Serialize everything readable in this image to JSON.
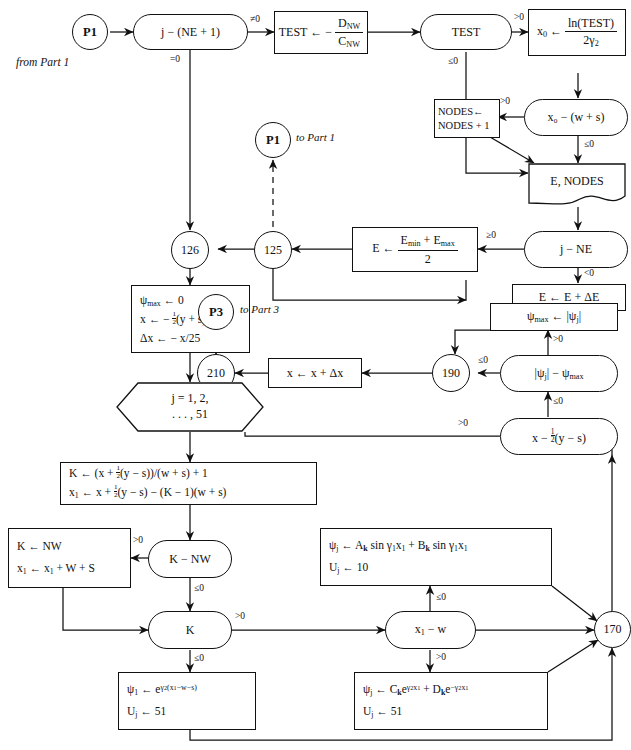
{
  "diagram": {
    "annotations": [
      {
        "name": "from-part-1-note",
        "text": "from Part 1"
      },
      {
        "name": "to-part-1-note",
        "text": "to Part 1"
      },
      {
        "name": "to-part-3-note",
        "text": "to Part 3"
      }
    ],
    "connectors": {
      "p1_in": "P1",
      "p1_out": "P1",
      "p3_out": "P3",
      "c126": "126",
      "c125": "125",
      "c210": "210",
      "c190": "190",
      "c170": "170"
    },
    "nodes": {
      "j_minus_ne1": "j − (NE + 1)",
      "test_assign_num": "D",
      "test_assign_num_sub": "NW",
      "test_assign_den": "C",
      "test_assign_den_sub": "NW",
      "test_assign_prefix": "TEST ← −",
      "test_decision": "TEST",
      "x0_assign_lhs": "x",
      "x0_assign_lhs_sub": "0",
      "x0_num": "ln(TEST)",
      "x0_den_coef": "2",
      "x0_den_sym": "γ",
      "x0_den_sub": "2",
      "x0_minus_ws": "x₀ − (w + s)",
      "nodes_incr_line1": "NODES←",
      "nodes_incr_line2": "NODES + 1",
      "e_nodes_doc": "E, NODES",
      "j_minus_ne": "j − NE",
      "e_bisect_prefix": "E ←",
      "e_bisect_num": "Eₘᵢₙ + Eₘₐₓ",
      "e_bisect_den": "2",
      "e_increment": "E ← E + ΔE",
      "init_line1": "ψₘₐₓ ← 0",
      "init_line2": "x ← − ½(y + s)",
      "init_line3": "Δx ← − x/25",
      "loop_line1": "j = 1, 2,",
      "loop_line2": ". . . , 51",
      "k_calc_line1": "K ← (x + ½(y − s))/(w + s) + 1",
      "k_calc_line2": "x₁ ← x + ½(y − s) − (K − 1)(w + s)",
      "k_minus_nw": "K − NW",
      "k_clamp_line1": "K ← NW",
      "k_clamp_line2": "x₁ ← x₁ + W + S",
      "k_decision": "K",
      "x1_minus_w": "x₁ − w",
      "psi_trig_line1": "ψⱼ ← Aₖ sin γ₁x₁ + Bₖ sin γ₁x₁",
      "psi_trig_line2": "Uⱼ ← 10",
      "psi_exp_line1": "ψⱼ ← Cₖe^{γ₂x₁} + Dₖe^{−γ₂x₁}",
      "psi_exp_line2": "Uⱼ ← 51",
      "psi1_exp_line1": "ψ₁ ← e^{γ₂(x₁−w−s)}",
      "psi1_exp_line2": "Uⱼ ← 51",
      "x_step": "x ← x + Δx",
      "psi_abs_cmp": "|ψⱼ| − ψₘₐₓ",
      "psimax_update": "ψₘₐₓ ← |ψⱼ|",
      "x_minus_half": "x − ½(y − s)"
    },
    "edge_labels": {
      "ne_zero": "≠0",
      "eq_zero": "=0",
      "gt_zero_test": ">0",
      "le_zero_test": "≤0",
      "gt_zero_x0": ">0",
      "le_zero_x0": "≤0",
      "ge_zero_jne": "≥0",
      "lt_zero_jne": "<0",
      "gt_zero_knw": ">0",
      "le_zero_knw": "≤0",
      "gt_zero_k": ">0",
      "le_zero_k": "≤0",
      "le_zero_x1w": "≤0",
      "gt_zero_x1w": ">0",
      "le_zero_psi": "≤0",
      "gt_zero_psi": ">0",
      "gt_zero_xhalf": ">0",
      "le_zero_xhalf": "≤0"
    }
  }
}
